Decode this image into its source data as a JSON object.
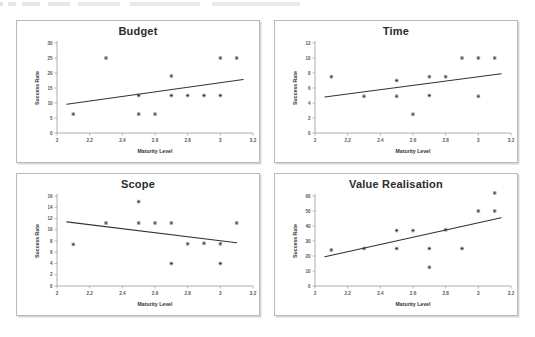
{
  "page": {
    "background_color": "#ffffff",
    "panel_border_color": "#b9b9bd",
    "marker_color": "#3a3a3a",
    "trendline_color": "#333333"
  },
  "charts": [
    {
      "id": "budget",
      "title": "Budget",
      "xlabel": "Maturity Level",
      "ylabel": "Success Rate",
      "xticks": [
        "2",
        "2.2",
        "2.4",
        "2.6",
        "2.8",
        "3",
        "3.2"
      ],
      "yticks": [
        "0",
        "5",
        "10",
        "15",
        "20",
        "25",
        "30"
      ],
      "xlim": [
        2,
        3.2
      ],
      "ylim": [
        0,
        30
      ],
      "points": [
        {
          "x": 2.1,
          "y": 6.3
        },
        {
          "x": 2.3,
          "y": 25
        },
        {
          "x": 2.5,
          "y": 12.5
        },
        {
          "x": 2.5,
          "y": 6.3
        },
        {
          "x": 2.6,
          "y": 6.3
        },
        {
          "x": 2.7,
          "y": 19
        },
        {
          "x": 2.7,
          "y": 12.5
        },
        {
          "x": 2.8,
          "y": 12.5
        },
        {
          "x": 2.9,
          "y": 12.5
        },
        {
          "x": 3.0,
          "y": 25
        },
        {
          "x": 3.0,
          "y": 12.5
        },
        {
          "x": 3.1,
          "y": 25
        }
      ],
      "trend": {
        "x0": 2.06,
        "y0": 9.6,
        "x1": 3.14,
        "y1": 17.8
      }
    },
    {
      "id": "time",
      "title": "Time",
      "xlabel": "Maturity Level",
      "ylabel": "Success Rate",
      "xticks": [
        "2",
        "2.2",
        "2.4",
        "2.6",
        "2.8",
        "3",
        "3.2"
      ],
      "yticks": [
        "0",
        "2",
        "4",
        "6",
        "8",
        "10",
        "12"
      ],
      "xlim": [
        2,
        3.2
      ],
      "ylim": [
        0,
        12
      ],
      "points": [
        {
          "x": 2.1,
          "y": 7.5
        },
        {
          "x": 2.3,
          "y": 4.9
        },
        {
          "x": 2.5,
          "y": 7.0
        },
        {
          "x": 2.5,
          "y": 4.9
        },
        {
          "x": 2.6,
          "y": 2.5
        },
        {
          "x": 2.7,
          "y": 7.5
        },
        {
          "x": 2.7,
          "y": 5.0
        },
        {
          "x": 2.8,
          "y": 7.5
        },
        {
          "x": 2.9,
          "y": 10.0
        },
        {
          "x": 3.0,
          "y": 10.0
        },
        {
          "x": 3.0,
          "y": 4.9
        },
        {
          "x": 3.1,
          "y": 10.0
        }
      ],
      "trend": {
        "x0": 2.06,
        "y0": 4.8,
        "x1": 3.14,
        "y1": 7.9
      }
    },
    {
      "id": "scope",
      "title": "Scope",
      "xlabel": "Maturity Level",
      "ylabel": "Success Rate",
      "xticks": [
        "2",
        "2.2",
        "2.4",
        "2.6",
        "2.8",
        "3",
        "3.2"
      ],
      "yticks": [
        "0",
        "2",
        "4",
        "6",
        "8",
        "10",
        "12",
        "14",
        "16"
      ],
      "xlim": [
        2,
        3.2
      ],
      "ylim": [
        0,
        16
      ],
      "points": [
        {
          "x": 2.1,
          "y": 7.4
        },
        {
          "x": 2.3,
          "y": 11.2
        },
        {
          "x": 2.5,
          "y": 15.0
        },
        {
          "x": 2.5,
          "y": 11.2
        },
        {
          "x": 2.6,
          "y": 11.2
        },
        {
          "x": 2.7,
          "y": 11.2
        },
        {
          "x": 2.7,
          "y": 4.0
        },
        {
          "x": 2.8,
          "y": 7.5
        },
        {
          "x": 2.9,
          "y": 7.6
        },
        {
          "x": 3.0,
          "y": 7.5
        },
        {
          "x": 3.0,
          "y": 4.0
        },
        {
          "x": 3.1,
          "y": 11.2
        }
      ],
      "trend": {
        "x0": 2.06,
        "y0": 11.4,
        "x1": 3.1,
        "y1": 7.7
      }
    },
    {
      "id": "value-realisation",
      "title": "Value Realisation",
      "xlabel": "Maturity Level",
      "ylabel": "Success Rate",
      "xticks": [
        "2",
        "2.2",
        "2.4",
        "2.6",
        "2.8",
        "3",
        "3.2"
      ],
      "yticks": [
        "0",
        "10",
        "20",
        "30",
        "40",
        "50",
        "60"
      ],
      "xlim": [
        2,
        3.2
      ],
      "ylim": [
        0,
        60
      ],
      "points": [
        {
          "x": 2.1,
          "y": 24
        },
        {
          "x": 2.3,
          "y": 25
        },
        {
          "x": 2.5,
          "y": 37
        },
        {
          "x": 2.5,
          "y": 25
        },
        {
          "x": 2.6,
          "y": 37
        },
        {
          "x": 2.7,
          "y": 25
        },
        {
          "x": 2.7,
          "y": 12.5
        },
        {
          "x": 2.8,
          "y": 37.5
        },
        {
          "x": 2.9,
          "y": 25
        },
        {
          "x": 3.0,
          "y": 50
        },
        {
          "x": 3.1,
          "y": 50
        },
        {
          "x": 3.1,
          "y": 62
        }
      ],
      "trend": {
        "x0": 2.06,
        "y0": 19.5,
        "x1": 3.14,
        "y1": 45.5
      }
    }
  ],
  "chart_data": [
    {
      "type": "scatter",
      "title": "Budget",
      "xlabel": "Maturity Level",
      "ylabel": "Success Rate",
      "xlim": [
        2,
        3.2
      ],
      "ylim": [
        0,
        30
      ],
      "xticks": [
        2,
        2.2,
        2.4,
        2.6,
        2.8,
        3,
        3.2
      ],
      "yticks": [
        0,
        5,
        10,
        15,
        20,
        25,
        30
      ],
      "grid": false,
      "legend": "none",
      "x": [
        2.1,
        2.3,
        2.5,
        2.5,
        2.6,
        2.7,
        2.7,
        2.8,
        2.9,
        3.0,
        3.0,
        3.1
      ],
      "y": [
        6.3,
        25,
        12.5,
        6.3,
        6.3,
        19,
        12.5,
        12.5,
        12.5,
        25,
        12.5,
        25
      ],
      "trendline": {
        "from": [
          2.06,
          9.6
        ],
        "to": [
          3.14,
          17.8
        ],
        "slope": "positive"
      }
    },
    {
      "type": "scatter",
      "title": "Time",
      "xlabel": "Maturity Level",
      "ylabel": "Success Rate",
      "xlim": [
        2,
        3.2
      ],
      "ylim": [
        0,
        12
      ],
      "xticks": [
        2,
        2.2,
        2.4,
        2.6,
        2.8,
        3,
        3.2
      ],
      "yticks": [
        0,
        2,
        4,
        6,
        8,
        10,
        12
      ],
      "grid": false,
      "legend": "none",
      "x": [
        2.1,
        2.3,
        2.5,
        2.5,
        2.6,
        2.7,
        2.7,
        2.8,
        2.9,
        3.0,
        3.0,
        3.1
      ],
      "y": [
        7.5,
        4.9,
        7.0,
        4.9,
        2.5,
        7.5,
        5.0,
        7.5,
        10.0,
        10.0,
        4.9,
        10.0
      ],
      "trendline": {
        "from": [
          2.06,
          4.8
        ],
        "to": [
          3.14,
          7.9
        ],
        "slope": "positive"
      }
    },
    {
      "type": "scatter",
      "title": "Scope",
      "xlabel": "Maturity Level",
      "ylabel": "Success Rate",
      "xlim": [
        2,
        3.2
      ],
      "ylim": [
        0,
        16
      ],
      "xticks": [
        2,
        2.2,
        2.4,
        2.6,
        2.8,
        3,
        3.2
      ],
      "yticks": [
        0,
        2,
        4,
        6,
        8,
        10,
        12,
        14,
        16
      ],
      "grid": false,
      "legend": "none",
      "x": [
        2.1,
        2.3,
        2.5,
        2.5,
        2.6,
        2.7,
        2.7,
        2.8,
        2.9,
        3.0,
        3.0,
        3.1
      ],
      "y": [
        7.4,
        11.2,
        15.0,
        11.2,
        11.2,
        11.2,
        4.0,
        7.5,
        7.6,
        7.5,
        4.0,
        11.2
      ],
      "trendline": {
        "from": [
          2.06,
          11.4
        ],
        "to": [
          3.1,
          7.7
        ],
        "slope": "negative"
      }
    },
    {
      "type": "scatter",
      "title": "Value Realisation",
      "xlabel": "Maturity Level",
      "ylabel": "Success Rate",
      "xlim": [
        2,
        3.2
      ],
      "ylim": [
        0,
        60
      ],
      "xticks": [
        2,
        2.2,
        2.4,
        2.6,
        2.8,
        3,
        3.2
      ],
      "yticks": [
        0,
        10,
        20,
        30,
        40,
        50,
        60
      ],
      "grid": false,
      "legend": "none",
      "x": [
        2.1,
        2.3,
        2.5,
        2.5,
        2.6,
        2.7,
        2.7,
        2.8,
        2.9,
        3.0,
        3.1,
        3.1
      ],
      "y": [
        24,
        25,
        37,
        25,
        37,
        25,
        12.5,
        37.5,
        25,
        50,
        50,
        62
      ],
      "trendline": {
        "from": [
          2.06,
          19.5
        ],
        "to": [
          3.14,
          45.5
        ],
        "slope": "positive"
      }
    }
  ]
}
